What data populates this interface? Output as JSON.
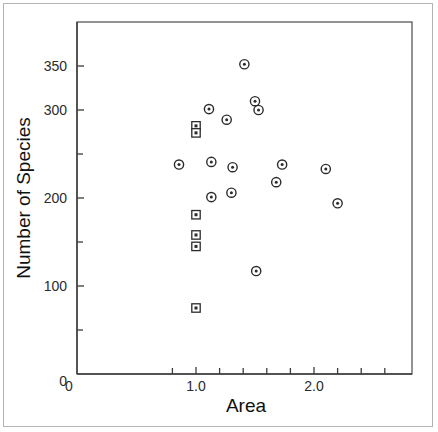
{
  "chart_data": {
    "type": "scatter",
    "title": "",
    "xlabel": "Area",
    "ylabel": "Number of Species",
    "xlim": [
      0,
      2.84
    ],
    "ylim": [
      0,
      400
    ],
    "grid": false,
    "legend": "none",
    "x_ticks_labeled": [
      {
        "value": 1.0,
        "label": "1.0"
      },
      {
        "value": 2.0,
        "label": "2.0"
      }
    ],
    "x_origin_label": "0",
    "x_ticks_minor": [
      0.8,
      1.2,
      1.4,
      1.6,
      1.8,
      2.2,
      2.4,
      2.6
    ],
    "y_ticks_labeled": [
      {
        "value": 350,
        "label": "350"
      },
      {
        "value": 300,
        "label": "300"
      },
      {
        "value": 200,
        "label": "200"
      },
      {
        "value": 100,
        "label": "100"
      }
    ],
    "y_origin_label": "0",
    "y_ticks_minor": [
      250,
      150,
      50
    ],
    "series": [
      {
        "name": "circle-markers",
        "marker": "circle-dot",
        "points": [
          {
            "x": 0.856,
            "y": 238
          },
          {
            "x": 1.11,
            "y": 301
          },
          {
            "x": 1.26,
            "y": 289
          },
          {
            "x": 1.41,
            "y": 352
          },
          {
            "x": 1.5,
            "y": 310
          },
          {
            "x": 1.53,
            "y": 300
          },
          {
            "x": 1.13,
            "y": 241
          },
          {
            "x": 1.31,
            "y": 235
          },
          {
            "x": 1.73,
            "y": 238
          },
          {
            "x": 2.1,
            "y": 233
          },
          {
            "x": 1.68,
            "y": 218
          },
          {
            "x": 1.3,
            "y": 206
          },
          {
            "x": 1.13,
            "y": 201
          },
          {
            "x": 2.2,
            "y": 194
          },
          {
            "x": 1.51,
            "y": 117
          }
        ]
      },
      {
        "name": "square-markers",
        "marker": "square-dot",
        "points": [
          {
            "x": 1.0,
            "y": 282
          },
          {
            "x": 1.0,
            "y": 274
          },
          {
            "x": 1.0,
            "y": 181
          },
          {
            "x": 1.0,
            "y": 158
          },
          {
            "x": 1.0,
            "y": 145
          },
          {
            "x": 1.0,
            "y": 75
          }
        ]
      }
    ]
  },
  "geometry": {
    "plot_left": 77,
    "plot_right": 412,
    "plot_top": 22,
    "plot_bottom": 374,
    "x_zero_px": 78,
    "x_unit_px": 118,
    "x_one_px": 196,
    "y_zero_px": 374,
    "y_unit_px": 0.88
  }
}
